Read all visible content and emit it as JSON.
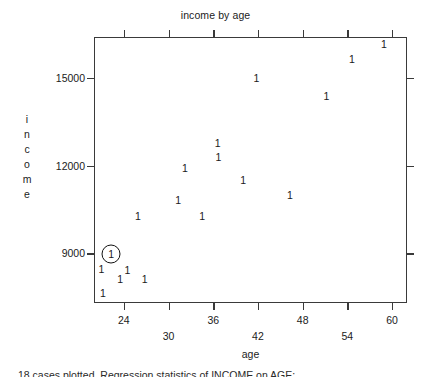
{
  "chart_data": {
    "type": "scatter",
    "title": "income by age",
    "xlabel": "age",
    "ylabel": "income",
    "xlim": [
      20,
      62
    ],
    "ylim": [
      7300,
      16400
    ],
    "grid": false,
    "legend": null,
    "marker_glyph": "1",
    "xticks": [
      24,
      30,
      36,
      42,
      48,
      54,
      60
    ],
    "xtick_labels": [
      "24",
      "30",
      "36",
      "42",
      "48",
      "54",
      "60"
    ],
    "yticks": [
      9000,
      12000,
      15000
    ],
    "ytick_labels": [
      "9000",
      "12000",
      "15000"
    ],
    "n_points": 18,
    "points": [
      {
        "label": "1",
        "x": 21.0,
        "y": 8450,
        "highlighted": false
      },
      {
        "label": "1",
        "x": 21.2,
        "y": 7650,
        "highlighted": false
      },
      {
        "label": "1",
        "x": 22.3,
        "y": 8990,
        "highlighted": true
      },
      {
        "label": "1",
        "x": 23.5,
        "y": 8110,
        "highlighted": false
      },
      {
        "label": "1",
        "x": 24.5,
        "y": 8440,
        "highlighted": false
      },
      {
        "label": "1",
        "x": 25.9,
        "y": 10290,
        "highlighted": false
      },
      {
        "label": "1",
        "x": 26.8,
        "y": 8120,
        "highlighted": false
      },
      {
        "label": "1",
        "x": 31.3,
        "y": 10810,
        "highlighted": false
      },
      {
        "label": "1",
        "x": 32.2,
        "y": 11930,
        "highlighted": false
      },
      {
        "label": "1",
        "x": 34.5,
        "y": 10290,
        "highlighted": false
      },
      {
        "label": "1",
        "x": 36.6,
        "y": 12790,
        "highlighted": false
      },
      {
        "label": "1",
        "x": 36.7,
        "y": 12310,
        "highlighted": false
      },
      {
        "label": "1",
        "x": 40.0,
        "y": 11500,
        "highlighted": false
      },
      {
        "label": "1",
        "x": 41.8,
        "y": 14990,
        "highlighted": false
      },
      {
        "label": "1",
        "x": 46.3,
        "y": 11010,
        "highlighted": false
      },
      {
        "label": "1",
        "x": 51.2,
        "y": 14370,
        "highlighted": false
      },
      {
        "label": "1",
        "x": 54.6,
        "y": 15660,
        "highlighted": false
      },
      {
        "label": "1",
        "x": 58.9,
        "y": 16170,
        "highlighted": false
      }
    ]
  },
  "footer": {
    "note": "18 cases plotted. Regression statistics of INCOME on AGE:"
  },
  "colors": {
    "axis": "#3a3a3a",
    "text": "#1b1b1b",
    "marker": "#191919",
    "background": "#ffffff"
  }
}
